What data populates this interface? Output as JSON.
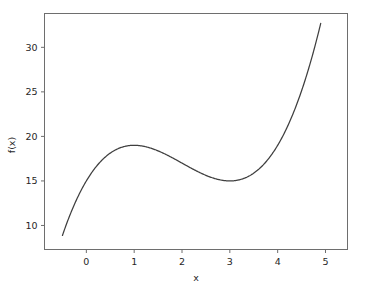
{
  "chart_data": {
    "type": "line",
    "title": "",
    "subtitle": "",
    "xlabel": "x",
    "ylabel": "f(x)",
    "xlim": [
      -0.875,
      5.46
    ],
    "ylim": [
      7.3,
      33.8
    ],
    "xticks": [
      0,
      1,
      2,
      3,
      4,
      5
    ],
    "xtick_labels": [
      "0",
      "1",
      "2",
      "3",
      "4",
      "5"
    ],
    "yticks": [
      10,
      15,
      20,
      25,
      30
    ],
    "ytick_labels": [
      "10",
      "15",
      "20",
      "25",
      "30"
    ],
    "grid": false,
    "legend": null,
    "legend_position": "none",
    "annotations": [],
    "series": [
      {
        "name": "f(x) = x^3 - 6x^2 + 9x + 15",
        "color": "#3f3f3f",
        "linewidth": 1.25,
        "x": [
          -0.5,
          -0.4,
          -0.3,
          -0.2,
          -0.1,
          0.0,
          0.1,
          0.2,
          0.3,
          0.4,
          0.5,
          0.6,
          0.7,
          0.8,
          0.9,
          1.0,
          1.1,
          1.2,
          1.3,
          1.4,
          1.5,
          1.6,
          1.7,
          1.8,
          1.9,
          2.0,
          2.1,
          2.2,
          2.3,
          2.4,
          2.5,
          2.6,
          2.7,
          2.8,
          2.9,
          3.0,
          3.1,
          3.2,
          3.3,
          3.4,
          3.5,
          3.6,
          3.7,
          3.8,
          3.9,
          4.0,
          4.1,
          4.2,
          4.3,
          4.4,
          4.5,
          4.6,
          4.7,
          4.8,
          4.9
        ],
        "y": [
          8.875,
          9.376,
          9.933,
          10.552,
          11.239,
          12.0,
          12.841,
          13.768,
          14.787,
          15.904,
          17.125,
          18.456,
          19.903,
          21.472,
          23.169,
          19.0,
          18.969,
          18.912,
          18.833,
          18.736,
          18.625,
          18.504,
          18.377,
          18.248,
          18.121,
          18.0,
          17.889,
          17.792,
          17.713,
          17.656,
          17.625,
          17.624,
          17.657,
          17.728,
          17.841,
          15.0,
          15.091,
          15.328,
          15.717,
          16.264,
          16.975,
          17.856,
          18.913,
          20.152,
          21.579,
          23.2,
          25.021,
          27.048,
          29.287,
          31.744,
          34.425,
          37.336,
          40.483,
          43.872,
          47.509
        ]
      }
    ],
    "function_expression": "x^3 - 6x^2 + 9x + 15",
    "key_points": {
      "local_maximum": {
        "x": 1,
        "y": 19
      },
      "local_minimum": {
        "x": 3,
        "y": 15
      },
      "left_endpoint": {
        "x": -0.5,
        "y": 8.875
      },
      "right_endpoint": {
        "x": 4.9,
        "y": 32.7
      }
    },
    "background_color": "#ffffff",
    "axes_color": "#6e6e6e"
  }
}
